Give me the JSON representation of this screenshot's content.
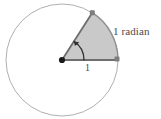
{
  "figure": {
    "background_color": "#ffffff",
    "labels": {
      "angle_label": "1 radian",
      "radius_label": "1"
    },
    "colors": {
      "circle_outline": "#b0b0b0",
      "sector_fill": "#c9c9c9",
      "sector_edge": "#8a8a8a",
      "radius_line": "#6e6e6e",
      "center_dot": "#1a1a1a",
      "arc_arrow": "#2a2a2a",
      "text": "#4a4a4a",
      "endpoint_marker": "#707070"
    },
    "geometry": {
      "center_x": 62,
      "center_y": 60,
      "radius": 56,
      "sector_start_angle_deg": 0,
      "sector_end_angle_deg": 57.2958,
      "angle_radians": 1,
      "arc_indicator_radius": 22
    },
    "elements": {
      "circle_name": "circle-outline",
      "sector_name": "shaded-sector",
      "center_name": "center-point",
      "radius_horizontal_name": "radius-horizontal",
      "radius_angled_name": "radius-angled",
      "arc_indicator_name": "angle-arc-arrow"
    }
  }
}
